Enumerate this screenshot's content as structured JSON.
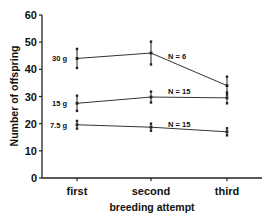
{
  "chart_data": {
    "type": "line",
    "title": "",
    "xlabel": "breeding attempt",
    "ylabel": "Number of offspring",
    "categories": [
      "first",
      "second",
      "third"
    ],
    "ylim": [
      0,
      60
    ],
    "yticks": [
      0,
      10,
      20,
      30,
      40,
      50,
      60
    ],
    "grid": false,
    "legend": "inline labels",
    "series": [
      {
        "name": "30 g",
        "annotation": "N = 6",
        "values": [
          44,
          46,
          34
        ],
        "errors": [
          3.5,
          4.2,
          3.3
        ]
      },
      {
        "name": "15 g",
        "annotation": "N = 15",
        "values": [
          27.5,
          29.8,
          29.5
        ],
        "errors": [
          2.8,
          2.0,
          2.0
        ]
      },
      {
        "name": "7.5 g",
        "annotation": "N = 15",
        "values": [
          19.6,
          18.7,
          17
        ],
        "errors": [
          1.4,
          1.3,
          1.3
        ]
      }
    ]
  }
}
